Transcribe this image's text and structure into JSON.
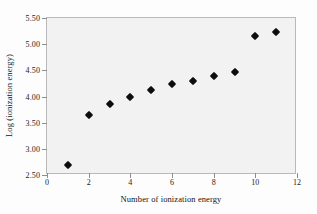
{
  "chart_data": {
    "type": "scatter",
    "title": "",
    "xlabel": "Number of ionization energy",
    "ylabel": "Log (ionization energy)",
    "xlim": [
      0,
      12
    ],
    "ylim": [
      2.5,
      5.5
    ],
    "xticks": [
      "0",
      "2",
      "4",
      "6",
      "8",
      "10",
      "12"
    ],
    "xtick_values": [
      0,
      2,
      4,
      6,
      8,
      10,
      12
    ],
    "yticks": [
      "2.50",
      "3.00",
      "3.50",
      "4.00",
      "4.50",
      "5.00",
      "5.50"
    ],
    "ytick_values": [
      2.5,
      3.0,
      3.5,
      4.0,
      4.5,
      5.0,
      5.5
    ],
    "grid": false,
    "legend": null,
    "marker": "diamond",
    "marker_color": "#0d0d0d",
    "plot_background": "#f2f2f2",
    "frame_color": "#b9b9b9",
    "x": [
      1,
      2,
      3,
      4,
      5,
      6,
      7,
      8,
      9,
      10,
      11
    ],
    "values": [
      2.7,
      3.65,
      3.85,
      4.0,
      4.13,
      4.23,
      4.3,
      4.4,
      4.46,
      5.15,
      5.23
    ],
    "points": [
      {
        "x": 1,
        "y": 2.7
      },
      {
        "x": 2,
        "y": 3.65
      },
      {
        "x": 3,
        "y": 3.85
      },
      {
        "x": 4,
        "y": 4.0
      },
      {
        "x": 5,
        "y": 4.13
      },
      {
        "x": 6,
        "y": 4.23
      },
      {
        "x": 7,
        "y": 4.3
      },
      {
        "x": 8,
        "y": 4.4
      },
      {
        "x": 9,
        "y": 4.46
      },
      {
        "x": 10,
        "y": 5.15
      },
      {
        "x": 11,
        "y": 5.23
      }
    ]
  }
}
